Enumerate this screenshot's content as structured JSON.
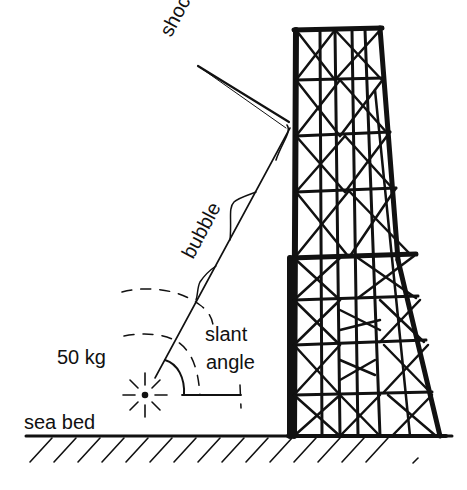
{
  "diagram": {
    "type": "underwater explosion near offshore platform",
    "labels": {
      "shock": "shock",
      "bubble": "bubble",
      "charge": "50 kg",
      "slant_line1": "slant",
      "slant_line2": "angle",
      "sea_bed": "sea bed"
    },
    "colors": {
      "ink": "#111111",
      "background": "#ffffff"
    },
    "elements": [
      "shock-front-line",
      "bubble-pulse-trace",
      "slant-ray",
      "explosion-charge-symbol",
      "dashed-wavefront-arcs",
      "slant-angle-arc",
      "sea-bed-line",
      "sea-bed-hatching",
      "lattice-tower-platform"
    ]
  }
}
